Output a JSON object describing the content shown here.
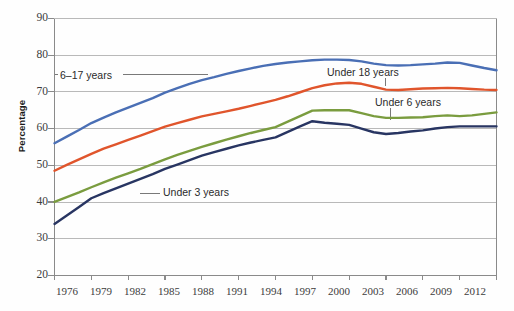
{
  "chart_data": {
    "type": "line",
    "title": "",
    "xlabel": "",
    "ylabel": "Percentage",
    "x": [
      1976,
      1977,
      1978,
      1979,
      1980,
      1981,
      1982,
      1983,
      1984,
      1985,
      1986,
      1987,
      1988,
      1989,
      1990,
      1991,
      1992,
      1993,
      1994,
      1995,
      1996,
      1997,
      1998,
      1999,
      2000,
      2001,
      2002,
      2003,
      2004,
      2005,
      2006,
      2007,
      2008,
      2009,
      2010,
      2011,
      2012
    ],
    "xticks": [
      "1976",
      "1979",
      "1982",
      "1985",
      "1988",
      "1991",
      "1994",
      "1997",
      "2000",
      "2003",
      "2006",
      "2009",
      "2012"
    ],
    "yticks": [
      "20",
      "30",
      "40",
      "50",
      "60",
      "70",
      "80",
      "90"
    ],
    "xlim": [
      1976,
      2012
    ],
    "ylim": [
      20,
      90
    ],
    "grid": true,
    "grid_axis": "y",
    "legend_position": "inline-annotations",
    "series": [
      {
        "name": "6–17 years",
        "color": "#4a6fb5",
        "label_x": 1978.6,
        "label_y": 74.5,
        "values": [
          56.0,
          57.8,
          59.6,
          61.5,
          63.0,
          64.4,
          65.7,
          67.0,
          68.3,
          69.8,
          71.0,
          72.2,
          73.2,
          74.0,
          74.9,
          75.7,
          76.4,
          77.1,
          77.6,
          78.0,
          78.3,
          78.6,
          78.8,
          78.8,
          78.7,
          78.3,
          77.7,
          77.3,
          77.2,
          77.3,
          77.5,
          77.7,
          78.0,
          77.9,
          77.2,
          76.5,
          75.9
        ]
      },
      {
        "name": "Under 18 years",
        "color": "#e0552c",
        "label_x": 1998.2,
        "label_y": 74.0,
        "values": [
          48.5,
          50.1,
          51.6,
          53.1,
          54.5,
          55.7,
          56.9,
          58.1,
          59.3,
          60.5,
          61.5,
          62.4,
          63.3,
          64.0,
          64.7,
          65.4,
          66.2,
          67.0,
          67.8,
          68.8,
          69.9,
          71.0,
          71.8,
          72.3,
          72.5,
          72.2,
          71.4,
          70.6,
          70.5,
          70.7,
          70.9,
          71.0,
          71.1,
          71.0,
          70.8,
          70.6,
          70.5
        ]
      },
      {
        "name": "Under 6 years",
        "color": "#7a9c3f",
        "label_x": 1999.5,
        "label_y": 67.5,
        "values": [
          40.0,
          41.3,
          42.6,
          44.0,
          45.3,
          46.6,
          47.8,
          49.0,
          50.3,
          51.6,
          52.8,
          53.9,
          55.0,
          56.0,
          57.0,
          57.9,
          58.8,
          59.6,
          60.4,
          61.9,
          63.4,
          64.9,
          65.0,
          65.0,
          65.0,
          64.2,
          63.4,
          62.9,
          62.9,
          63.0,
          63.1,
          63.4,
          63.6,
          63.4,
          63.6,
          64.0,
          64.4
        ]
      },
      {
        "name": "Under 3 years",
        "color": "#283562",
        "label_x": 1987.0,
        "label_y": 44.0,
        "values": [
          34.0,
          36.3,
          38.6,
          41.0,
          42.4,
          43.7,
          45.0,
          46.3,
          47.6,
          49.0,
          50.2,
          51.4,
          52.6,
          53.6,
          54.5,
          55.4,
          56.2,
          56.9,
          57.6,
          59.1,
          60.6,
          62.0,
          61.6,
          61.3,
          61.0,
          60.0,
          59.0,
          58.5,
          58.8,
          59.2,
          59.5,
          60.0,
          60.4,
          60.6,
          60.6,
          60.6,
          60.6
        ]
      }
    ]
  },
  "annotations": {
    "six_to_17": "6–17 years",
    "under_18": "Under 18 years",
    "under_6": "Under 6 years",
    "under_3": "Under 3 years"
  },
  "axes": {
    "y_axis_title": "Percentage"
  },
  "colors": {
    "blue": "#4a6fb5",
    "orange": "#e0552c",
    "green": "#7a9c3f",
    "navy": "#283562",
    "grid": "#b9b9b9",
    "axis": "#8a8a8a",
    "text": "#3c3c3c"
  }
}
